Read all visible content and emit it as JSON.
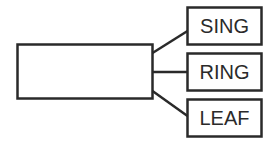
{
  "diagram": {
    "type": "tree",
    "root": {
      "label": ""
    },
    "children": [
      {
        "label": "SING"
      },
      {
        "label": "RING"
      },
      {
        "label": "LEAF"
      }
    ],
    "colors": {
      "stroke": "#2a2a2a",
      "background": "#ffffff"
    }
  }
}
